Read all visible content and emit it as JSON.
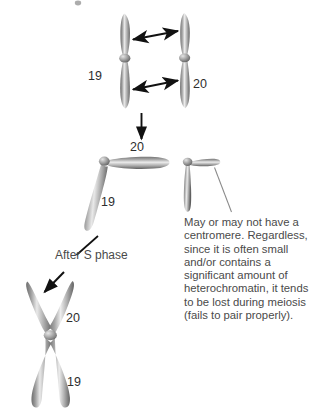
{
  "figure": {
    "background_color": "#ffffff",
    "width": 319,
    "height": 417,
    "ink_color": "#3b3b3b",
    "chromatid_color": "#8d8d8d",
    "chromatid_highlight": "#e6e6e6",
    "chromatid_shadow": "#5a5a5a",
    "arrow_color": "#111111",
    "leader_color": "#7a7a7a"
  },
  "panels": {
    "top": {
      "name": "unreplicated-pair-panel",
      "left_label": "19",
      "right_label": "20",
      "arrow_top_name": "double-headed-arrow-upper-arm",
      "arrow_bottom_name": "double-headed-arrow-lower-arm"
    },
    "middle": {
      "name": "translocation-panel",
      "large_upper_label": "20",
      "large_lower_label": "19",
      "small_fragment_name": "small-chromosome-fragment"
    },
    "bottom": {
      "name": "replicated-chromosome-panel",
      "upper_label": "20",
      "lower_label": "19",
      "phase_label": "After S phase"
    }
  },
  "annotations": {
    "note_text": "May or may not have a centromere. Regardless, since it is often small and/or contains a significant amount of heterochromatin, it tends to be lost during meiosis (fails to pair properly).",
    "transition_arrow_name": "downward-transition-arrow",
    "phase_arrow_name": "after-s-phase-arrow",
    "note_leader_name": "note-leader-line"
  }
}
